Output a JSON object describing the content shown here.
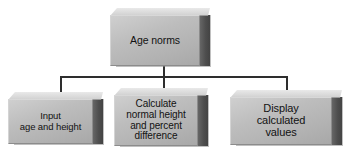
{
  "diagram": {
    "type": "hierarchy-flowchart",
    "background_color": "#ffffff",
    "box_face_color": "#bdbdbd",
    "box_side_color": "#4e4e4e",
    "box_top_color": "#dcdcdc",
    "connector_color": "#2e2e2e",
    "text_color": "#121212",
    "nodes": [
      {
        "id": "root",
        "label": "Age norms",
        "level": 0
      },
      {
        "id": "input",
        "label": "Input\nage and height",
        "level": 1
      },
      {
        "id": "calculate",
        "label": "Calculate\nnormal height\nand percent\ndifference",
        "level": 1
      },
      {
        "id": "display",
        "label": "Display\ncalculated\nvalues",
        "level": 1
      }
    ],
    "edges": [
      {
        "from": "root",
        "to": "input"
      },
      {
        "from": "root",
        "to": "calculate"
      },
      {
        "from": "root",
        "to": "display"
      }
    ]
  }
}
